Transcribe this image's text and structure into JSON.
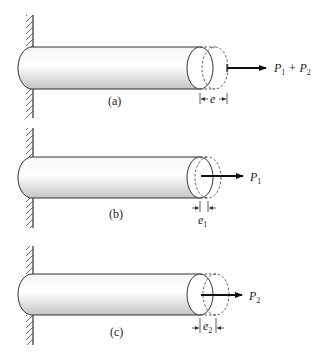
{
  "figure": {
    "panels": [
      {
        "id": "a",
        "caption": "(a)",
        "load_label": "P",
        "load_sub1": "1",
        "load_plus": " + P",
        "load_sub2": "2",
        "elongation_label": "e",
        "elongation_sub": ""
      },
      {
        "id": "b",
        "caption": "(b)",
        "load_label": "P",
        "load_sub1": "1",
        "elongation_label": "e",
        "elongation_sub": "1"
      },
      {
        "id": "c",
        "caption": "(c)",
        "load_label": "P",
        "load_sub1": "2",
        "elongation_label": "e",
        "elongation_sub": "2"
      }
    ],
    "colors": {
      "line": "#333333",
      "shade_light": "#ffffff",
      "shade_dark": "#c8c8c8",
      "arrow": "#111111"
    }
  }
}
